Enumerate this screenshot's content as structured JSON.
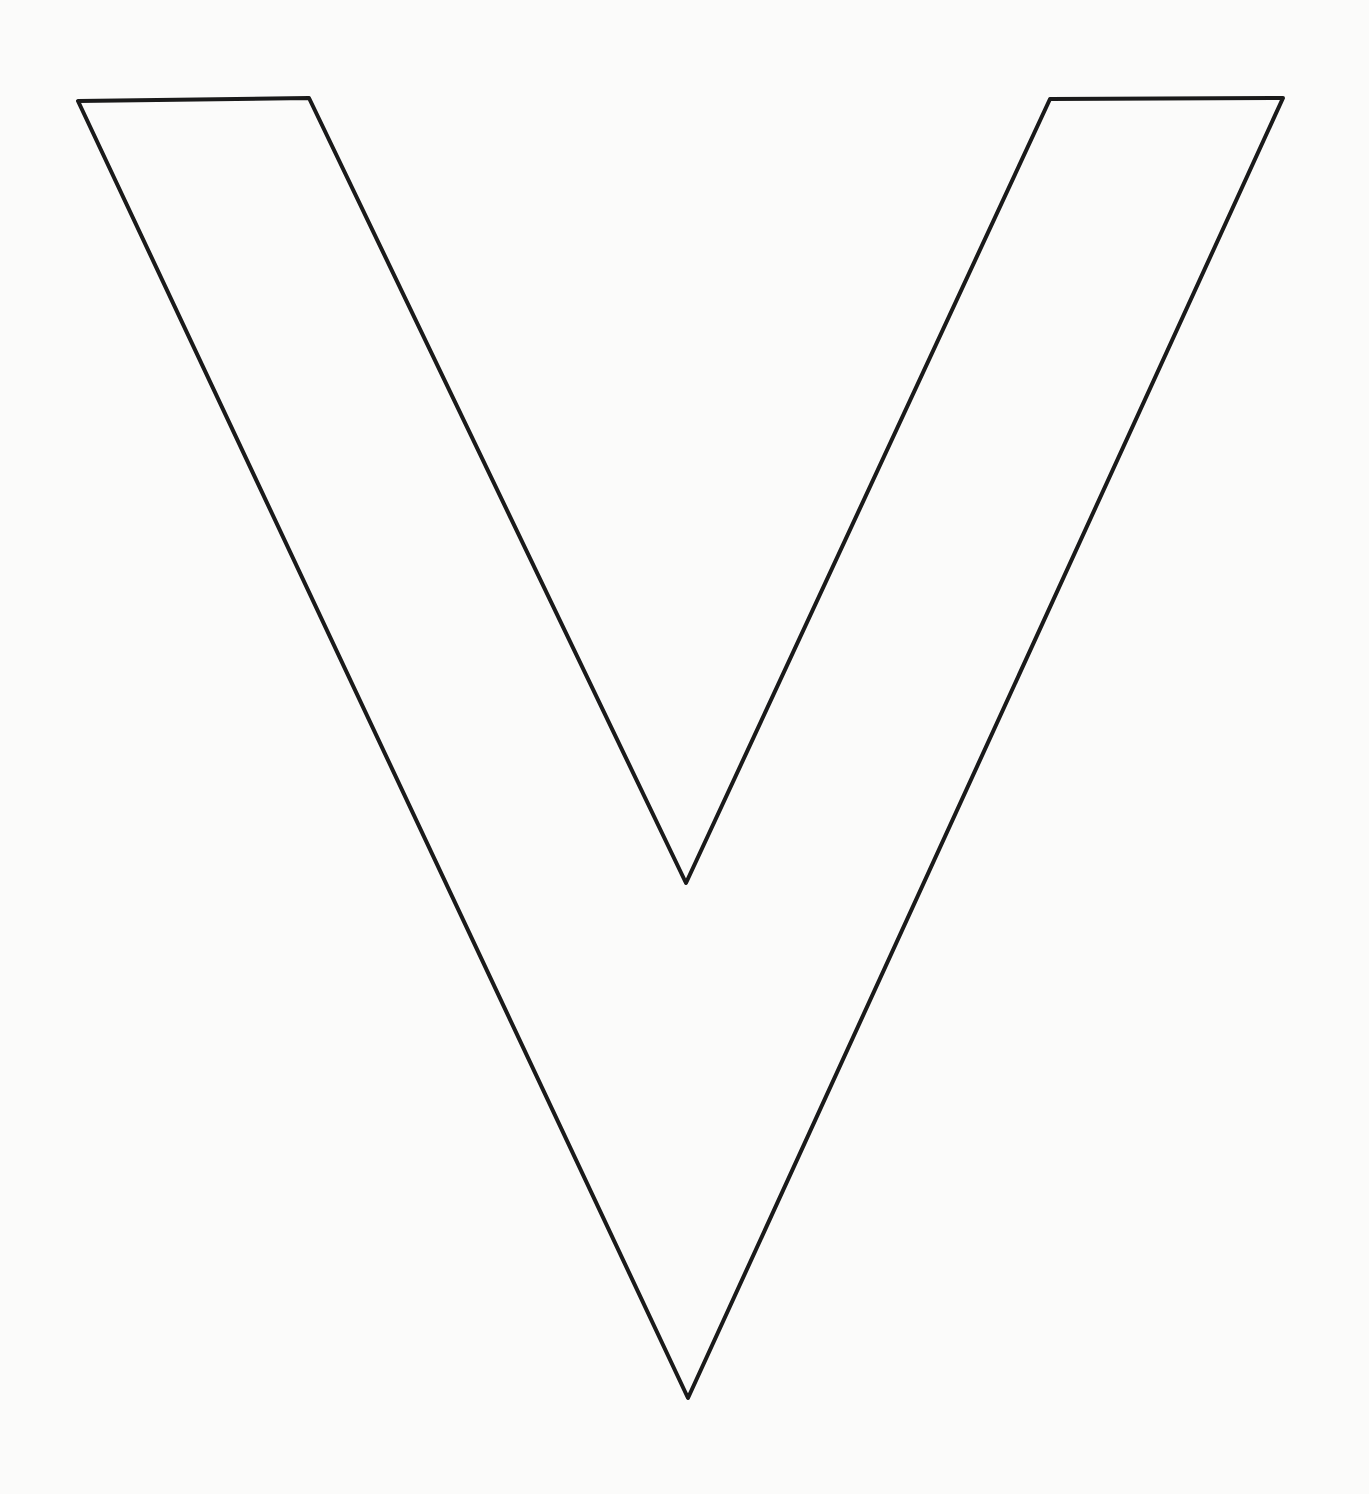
{
  "figure": {
    "label": "V",
    "background_color": "#fbfbfa",
    "stroke_color": "#1a1a1a",
    "stroke_width": 4,
    "outline_points": [
      [
        78,
        101
      ],
      [
        309,
        98
      ],
      [
        686,
        883
      ],
      [
        1050,
        99
      ],
      [
        1283,
        98
      ],
      [
        688,
        1398
      ]
    ]
  }
}
